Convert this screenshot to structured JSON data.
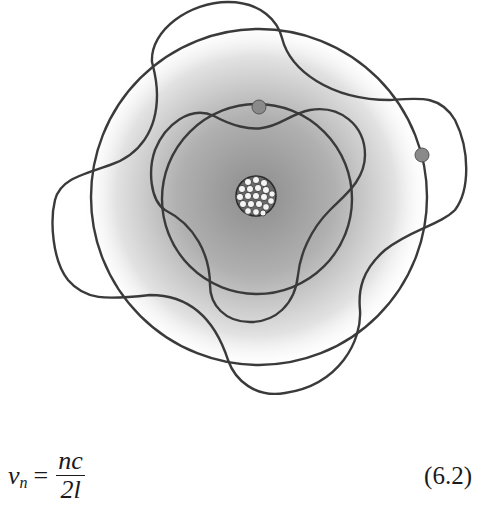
{
  "figure": {
    "nucleus": {
      "cx": 256,
      "cy": 196,
      "r": 21
    },
    "inner_orbit": {
      "cx": 257,
      "cy": 199,
      "r": 95,
      "wave_lobes": 3
    },
    "outer_orbit": {
      "cx": 259,
      "cy": 197,
      "r": 168,
      "wave_lobes": 4
    },
    "electrons": [
      {
        "cx": 259,
        "cy": 107
      },
      {
        "cx": 422,
        "cy": 155
      }
    ],
    "colors": {
      "line": "#3a3a3a",
      "glow": "#8c8c8c",
      "electron": "#8a8a8a"
    }
  },
  "equation": {
    "lhs_symbol": "ν",
    "lhs_subscript": "n",
    "equals": "=",
    "numerator": "nc",
    "denominator": "2l",
    "number": "(6.2)"
  }
}
